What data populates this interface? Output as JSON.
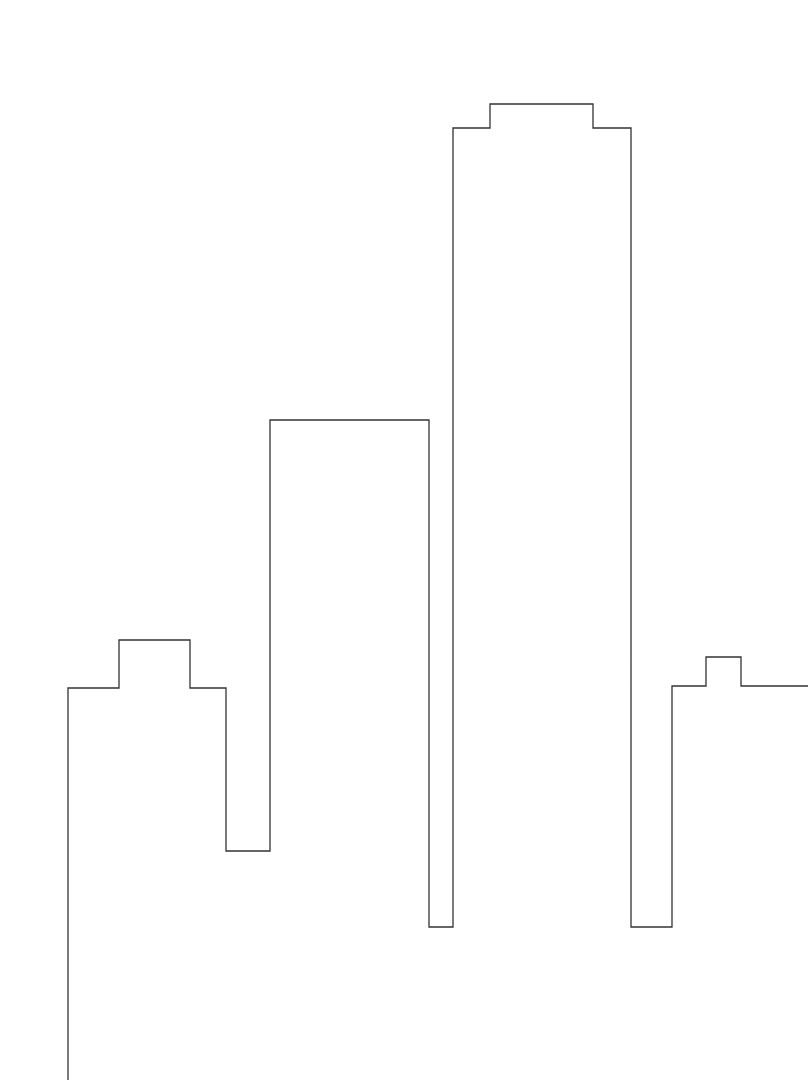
{
  "canvas": {
    "width": 811,
    "height": 1086,
    "background": "#ffffff"
  },
  "drawing": {
    "type": "skyline-outline",
    "stroke": "#333333",
    "stroke_width": 1.3,
    "points": [
      [
        68,
        1080
      ],
      [
        68,
        688
      ],
      [
        119,
        688
      ],
      [
        119,
        640
      ],
      [
        190,
        640
      ],
      [
        190,
        688
      ],
      [
        226,
        688
      ],
      [
        226,
        851
      ],
      [
        270,
        851
      ],
      [
        270,
        420
      ],
      [
        429,
        420
      ],
      [
        429,
        927
      ],
      [
        453,
        927
      ],
      [
        453,
        128
      ],
      [
        490,
        128
      ],
      [
        490,
        104
      ],
      [
        593,
        104
      ],
      [
        593,
        128
      ],
      [
        631,
        128
      ],
      [
        631,
        927
      ],
      [
        672,
        927
      ],
      [
        672,
        686
      ],
      [
        706,
        686
      ],
      [
        706,
        657
      ],
      [
        741,
        657
      ],
      [
        741,
        686
      ],
      [
        808,
        686
      ]
    ]
  }
}
